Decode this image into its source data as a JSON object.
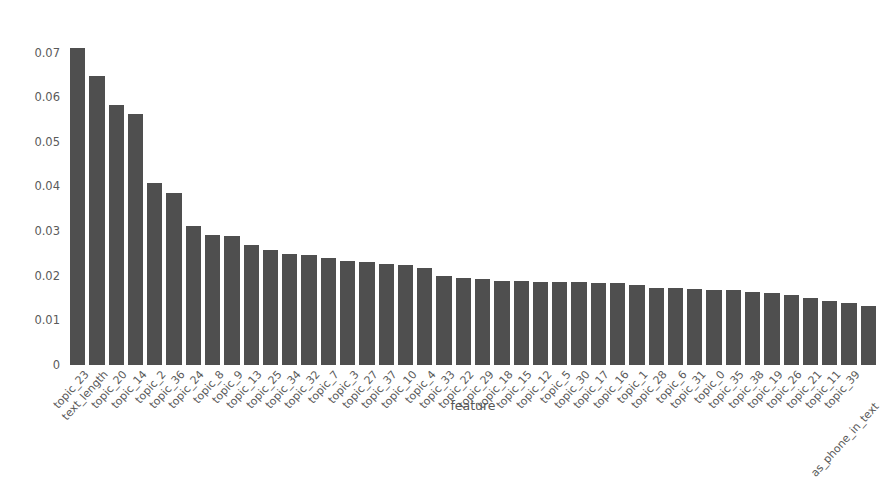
{
  "chart_data": {
    "type": "bar",
    "title": "",
    "xlabel": "feature",
    "ylabel": "relative importance",
    "ylim": [
      0,
      0.0735
    ],
    "yticks": [
      "0",
      "0.01",
      "0.02",
      "0.03",
      "0.04",
      "0.05",
      "0.06",
      "0.07"
    ],
    "ytick_values": [
      0,
      0.01,
      0.02,
      0.03,
      0.04,
      0.05,
      0.06,
      0.07
    ],
    "grid": false,
    "legend": null,
    "bar_color": "#4f4f4f",
    "categories": [
      "topic_23",
      "text_length",
      "topic_20",
      "topic_14",
      "topic_2",
      "topic_36",
      "topic_24",
      "topic_8",
      "topic_9",
      "topic_13",
      "topic_25",
      "topic_34",
      "topic_32",
      "topic_7",
      "topic_3",
      "topic_27",
      "topic_37",
      "topic_10",
      "topic_4",
      "topic_33",
      "topic_22",
      "topic_29",
      "topic_18",
      "topic_15",
      "topic_12",
      "topic_5",
      "topic_30",
      "topic_17",
      "topic_16",
      "topic_1",
      "topic_28",
      "topic_6",
      "topic_31",
      "topic_0",
      "topic_35",
      "topic_38",
      "topic_19",
      "topic_26",
      "topic_21",
      "topic_11",
      "topic_39",
      "as_phone_in_text"
    ],
    "values": [
      0.071,
      0.0648,
      0.0582,
      0.0562,
      0.0408,
      0.0386,
      0.0312,
      0.0292,
      0.0288,
      0.0268,
      0.0258,
      0.0249,
      0.0247,
      0.024,
      0.0234,
      0.0231,
      0.0226,
      0.0224,
      0.0217,
      0.0199,
      0.0196,
      0.0192,
      0.0189,
      0.0188,
      0.0187,
      0.0186,
      0.0185,
      0.0184,
      0.0183,
      0.0179,
      0.0173,
      0.0172,
      0.0171,
      0.0169,
      0.0167,
      0.0164,
      0.0162,
      0.0157,
      0.015,
      0.0144,
      0.0139,
      0.0133
    ]
  }
}
